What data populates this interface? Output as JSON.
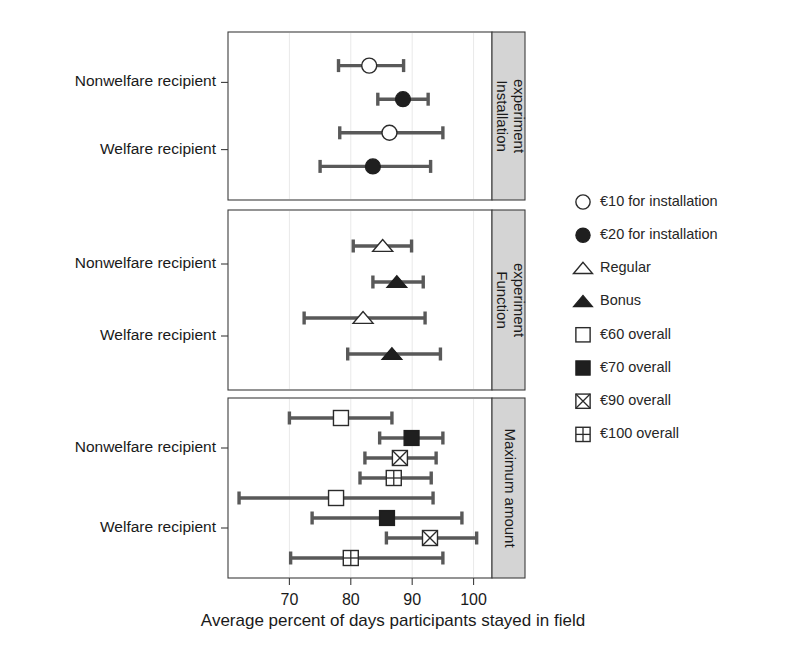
{
  "chart_data": {
    "type": "scatter",
    "title": "",
    "xlabel": "Average percent of days participants stayed in field",
    "ylabel": "",
    "xlim": [
      60,
      103
    ],
    "xticks": [
      70,
      80,
      90,
      100
    ],
    "xticklabels": [
      "70",
      "80",
      "90",
      "100"
    ],
    "grid": true,
    "legend_position": "right",
    "group_labels": [
      "Nonwelfare recipient",
      "Welfare recipient"
    ],
    "panels": [
      {
        "strip_label": "Installation experiment",
        "strip_line1": "Installation",
        "strip_line2": "experiment",
        "rows": [
          {
            "group": "Nonwelfare recipient",
            "series": "€10 for installation",
            "marker": "circle-open",
            "value": 83.0,
            "low": 78.0,
            "high": 88.6
          },
          {
            "group": "Nonwelfare recipient",
            "series": "€20 for installation",
            "marker": "circle-filled",
            "value": 88.5,
            "low": 84.4,
            "high": 92.6
          },
          {
            "group": "Welfare recipient",
            "series": "€10 for installation",
            "marker": "circle-open",
            "value": 86.3,
            "low": 78.2,
            "high": 95.0
          },
          {
            "group": "Welfare recipient",
            "series": "€20 for installation",
            "marker": "circle-filled",
            "value": 83.6,
            "low": 75.0,
            "high": 93.0
          }
        ]
      },
      {
        "strip_label": "Function experiment",
        "strip_line1": "Function",
        "strip_line2": "experiment",
        "rows": [
          {
            "group": "Nonwelfare recipient",
            "series": "Regular",
            "marker": "triangle-open",
            "value": 85.2,
            "low": 80.4,
            "high": 89.9
          },
          {
            "group": "Nonwelfare recipient",
            "series": "Bonus",
            "marker": "triangle-filled",
            "value": 87.5,
            "low": 83.6,
            "high": 91.8
          },
          {
            "group": "Welfare recipient",
            "series": "Regular",
            "marker": "triangle-open",
            "value": 82.0,
            "low": 72.4,
            "high": 92.1
          },
          {
            "group": "Welfare recipient",
            "series": "Bonus",
            "marker": "triangle-filled",
            "value": 86.7,
            "low": 79.5,
            "high": 94.6
          }
        ]
      },
      {
        "strip_label": "Maximum amount",
        "strip_line1": "Maximum amount",
        "strip_line2": "",
        "rows": [
          {
            "group": "Nonwelfare recipient",
            "series": "€60 overall",
            "marker": "square-open",
            "value": 78.4,
            "low": 70.0,
            "high": 86.7
          },
          {
            "group": "Nonwelfare recipient",
            "series": "€70 overall",
            "marker": "square-filled",
            "value": 89.9,
            "low": 84.7,
            "high": 95.0
          },
          {
            "group": "Nonwelfare recipient",
            "series": "€90 overall",
            "marker": "square-x",
            "value": 88.0,
            "low": 82.3,
            "high": 93.9
          },
          {
            "group": "Nonwelfare recipient",
            "series": "€100 overall",
            "marker": "square-plus",
            "value": 87.0,
            "low": 81.5,
            "high": 93.1
          },
          {
            "group": "Welfare recipient",
            "series": "€60 overall",
            "marker": "square-open",
            "value": 77.6,
            "low": 61.8,
            "high": 93.4
          },
          {
            "group": "Welfare recipient",
            "series": "€70 overall",
            "marker": "square-filled",
            "value": 85.9,
            "low": 73.7,
            "high": 98.1
          },
          {
            "group": "Welfare recipient",
            "series": "€90 overall",
            "marker": "square-x",
            "value": 92.9,
            "low": 85.8,
            "high": 100.5
          },
          {
            "group": "Welfare recipient",
            "series": "€100 overall",
            "marker": "square-plus",
            "value": 80.0,
            "low": 70.2,
            "high": 95.0
          }
        ]
      }
    ],
    "legend": [
      {
        "marker": "circle-open",
        "label": "€10 for installation"
      },
      {
        "marker": "circle-filled",
        "label": "€20 for installation"
      },
      {
        "marker": "triangle-open",
        "label": "Regular"
      },
      {
        "marker": "triangle-filled",
        "label": "Bonus"
      },
      {
        "marker": "square-open",
        "label": "€60 overall"
      },
      {
        "marker": "square-filled",
        "label": "€70 overall"
      },
      {
        "marker": "square-x",
        "label": "€90 overall"
      },
      {
        "marker": "square-plus",
        "label": "€100 overall"
      }
    ],
    "colors": {
      "errorbar": "#595959",
      "marker_fill_dark": "#1f1f1f",
      "marker_stroke": "#2b2b2b",
      "strip_background": "#d4d4d4",
      "panel_border": "#3d3d3d",
      "grid": "#e9e9e9",
      "text": "#1a1a1a",
      "background": "#ffffff"
    }
  }
}
